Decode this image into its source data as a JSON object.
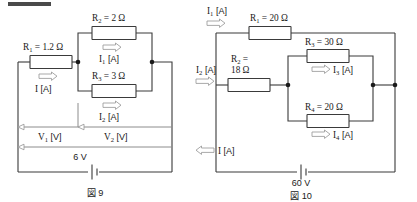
{
  "page": {
    "background_color": "#ffffff",
    "ink_color": "#1a1a1a",
    "wire_color": "#3a3a3a",
    "accent_gray": "#8c8c8c",
    "top_rule_color": "#4a4a4a"
  },
  "figure9": {
    "caption": "図 9",
    "source_voltage": "6 V",
    "components": [
      {
        "id": "R1",
        "label": "R",
        "sub": "1",
        "eq": " = 1.2 Ω"
      },
      {
        "id": "R2",
        "label": "R",
        "sub": "2",
        "eq": " = 2 Ω"
      },
      {
        "id": "R3",
        "label": "R",
        "sub": "3",
        "eq": " = 3 Ω"
      }
    ],
    "currents": [
      {
        "id": "I",
        "label": "I",
        "sub": "",
        "unit": " [A]",
        "direction": "right"
      },
      {
        "id": "I1",
        "label": "I",
        "sub": "1",
        "unit": " [A]",
        "direction": "right"
      },
      {
        "id": "I2",
        "label": "I",
        "sub": "2",
        "unit": " [A]",
        "direction": "right"
      }
    ],
    "voltages": [
      {
        "id": "V1",
        "label": "V",
        "sub": "1",
        "unit": " [V]"
      },
      {
        "id": "V2",
        "label": "V",
        "sub": "2",
        "unit": " [V]"
      }
    ]
  },
  "figure10": {
    "caption": "図 10",
    "source_voltage": "60 V",
    "components": [
      {
        "id": "R1",
        "label": "R",
        "sub": "1",
        "eq": " = 20 Ω"
      },
      {
        "id": "R2",
        "label": "R",
        "sub": "2",
        "eq": " =",
        "eq2": "18 Ω"
      },
      {
        "id": "R3",
        "label": "R",
        "sub": "3",
        "eq": " = 30 Ω"
      },
      {
        "id": "R4",
        "label": "R",
        "sub": "4",
        "eq": " = 20 Ω"
      }
    ],
    "currents": [
      {
        "id": "I1",
        "label": "I",
        "sub": "1",
        "unit": " [A]",
        "direction": "right"
      },
      {
        "id": "I2",
        "label": "I",
        "sub": "2",
        "unit": " [A]",
        "direction": "right"
      },
      {
        "id": "I3",
        "label": "I",
        "sub": "3",
        "unit": " [A]",
        "direction": "right"
      },
      {
        "id": "I4",
        "label": "I",
        "sub": "4",
        "unit": " [A]",
        "direction": "right"
      },
      {
        "id": "I",
        "label": "I",
        "sub": "",
        "unit": " [A]",
        "direction": "left"
      }
    ]
  }
}
